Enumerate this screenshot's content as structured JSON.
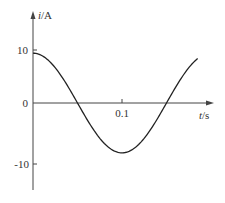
{
  "chart_data": {
    "type": "line",
    "title": "",
    "xlabel": "t/s",
    "ylabel": "i/A",
    "xlabel_var": "t",
    "xlabel_unit": "/s",
    "ylabel_var": "i",
    "ylabel_unit": "/A",
    "x_ticks": [
      {
        "value": 0.1,
        "label": "0.1"
      }
    ],
    "y_ticks": [
      {
        "value": 10,
        "label": "10"
      },
      {
        "value": 0,
        "label": "0"
      },
      {
        "value": -10,
        "label": "-10"
      }
    ],
    "xlim": [
      0,
      0.2
    ],
    "ylim": [
      -13,
      15
    ],
    "grid": false,
    "legend": null,
    "series": [
      {
        "name": "i(t)",
        "description": "sinusoidal current, i = 10 cos(10πt)",
        "amplitude": 10,
        "period": 0.2,
        "x": [
          0,
          0.025,
          0.05,
          0.075,
          0.1,
          0.125,
          0.15,
          0.175,
          0.185
        ],
        "values": [
          10,
          7.07,
          0,
          -7.07,
          -10,
          -7.07,
          0,
          7.07,
          8.9
        ]
      }
    ],
    "colors": {
      "curve": "#222222",
      "axes": "#444444",
      "text": "#333333"
    }
  }
}
